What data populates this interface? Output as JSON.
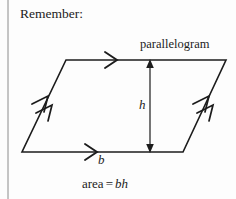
{
  "figure": {
    "heading": "Remember:",
    "shape_label": "parallelogram",
    "height_label": "h",
    "base_label": "b",
    "formula": {
      "lhs": "area",
      "equals": "=",
      "rhs_base": "b",
      "rhs_height": "h",
      "full": "area = bh"
    },
    "colors": {
      "background": "#fdfdfd",
      "ink": "#1c1c1c",
      "rule": "#8c8c8c"
    },
    "geometry": {
      "top_left": [
        66,
        60
      ],
      "top_right": [
        226,
        60
      ],
      "bottom_right": [
        183,
        152
      ],
      "bottom_left": [
        22,
        152
      ],
      "height_arrow_x": 150,
      "height_arrow_top_y": 60,
      "height_arrow_bottom_y": 152,
      "margin_rule_x": 8
    },
    "markers": {
      "top_edge": "single-chevron-right",
      "bottom_edge": "single-chevron-right",
      "left_edge": "double-chevron-up",
      "right_edge": "double-chevron-up",
      "height": "double-headed-vertical-arrow"
    }
  }
}
